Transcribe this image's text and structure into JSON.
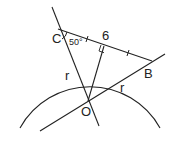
{
  "diagram": {
    "points": {
      "C": {
        "label": "C",
        "x": 58,
        "y": 29
      },
      "B": {
        "label": "B",
        "x": 152,
        "y": 61
      },
      "O": {
        "label": "O",
        "x": 88,
        "y": 101
      }
    },
    "labels": {
      "angle": "50°",
      "chord_length": "6",
      "radius_CO": "r",
      "radius_OB": "r"
    },
    "colors": {
      "stroke": "#222222",
      "background": "#ffffff"
    }
  }
}
